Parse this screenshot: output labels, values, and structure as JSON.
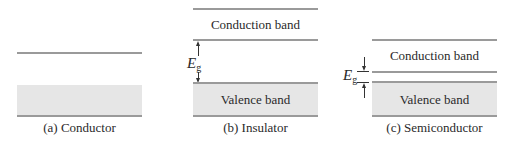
{
  "diagrams": [
    {
      "id": "conductor",
      "caption": "(a) Conductor",
      "bands": []
    },
    {
      "id": "insulator",
      "caption": "(b) Insulator",
      "bands": [
        "Conduction band",
        "Valence band"
      ],
      "gap_label": "E",
      "gap_sub": "g"
    },
    {
      "id": "semiconductor",
      "caption": "(c) Semiconductor",
      "bands": [
        "Conduction band",
        "Valence band"
      ],
      "gap_label": "E",
      "gap_sub": "g"
    }
  ],
  "colors": {
    "band_fill": "#e6e6e6",
    "band_line": "#9a9a9a"
  }
}
